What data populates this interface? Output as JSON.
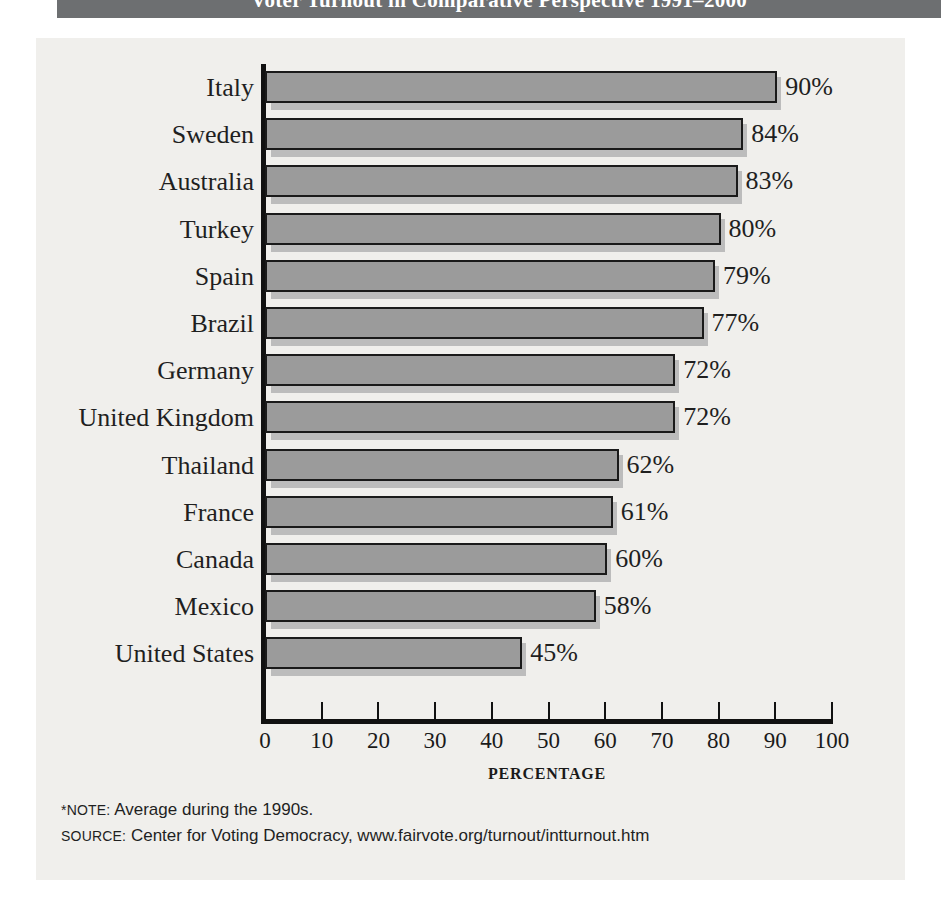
{
  "header": {
    "title": "Voter Turnout in Comparative Perspective 1991–2000",
    "band_color": "#6d6f71"
  },
  "panel": {
    "background": "#f0efec"
  },
  "chart_data": {
    "type": "bar",
    "orientation": "horizontal",
    "title": "Voter Turnout in Comparative Perspective 1991–2000",
    "xlabel": "PERCENTAGE",
    "ylabel": "",
    "xlim": [
      0,
      100
    ],
    "xticks": [
      "0",
      "10",
      "20",
      "30",
      "40",
      "50",
      "60",
      "70",
      "80",
      "90",
      "100"
    ],
    "grid": false,
    "legend": null,
    "categories": [
      "Italy",
      "Sweden",
      "Australia",
      "Turkey",
      "Spain",
      "Brazil",
      "Germany",
      "United Kingdom",
      "Thailand",
      "France",
      "Canada",
      "Mexico",
      "United States"
    ],
    "values": [
      90,
      84,
      83,
      80,
      79,
      77,
      72,
      72,
      62,
      61,
      60,
      58,
      45
    ],
    "value_labels": [
      "90%",
      "84%",
      "83%",
      "80%",
      "79%",
      "77%",
      "72%",
      "72%",
      "62%",
      "61%",
      "60%",
      "58%",
      "45%"
    ],
    "bar_color": "#9b9b9b",
    "bar_edge_color": "#1a1a1a",
    "shadow_color": "#bcbcbc"
  },
  "footnotes": {
    "note_label": "*NOTE:",
    "note_text": " Average during the 1990s.",
    "source_label": "SOURCE:",
    "source_text": " Center for Voting Democracy, www.fairvote.org/turnout/intturnout.htm"
  }
}
